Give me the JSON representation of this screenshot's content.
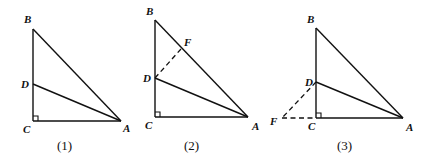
{
  "figures": [
    {
      "caption": "(1)",
      "points": {
        "B": "B",
        "D": "D",
        "C": "C",
        "A": "A"
      },
      "segments": [
        "BC",
        "CA",
        "AB",
        "AD"
      ],
      "dashed_segments": [],
      "right_angle_at": "C"
    },
    {
      "caption": "(2)",
      "points": {
        "B": "B",
        "F": "F",
        "D": "D",
        "C": "C",
        "A": "A"
      },
      "segments": [
        "BC",
        "CA",
        "AB",
        "AD"
      ],
      "dashed_segments": [
        "DF"
      ],
      "right_angle_at": "C"
    },
    {
      "caption": "(3)",
      "points": {
        "B": "B",
        "D": "D",
        "C": "C",
        "A": "A",
        "F": "F"
      },
      "segments": [
        "BC",
        "CA",
        "AB",
        "AD"
      ],
      "dashed_segments": [
        "DF",
        "FC"
      ],
      "right_angle_at": "C"
    }
  ]
}
